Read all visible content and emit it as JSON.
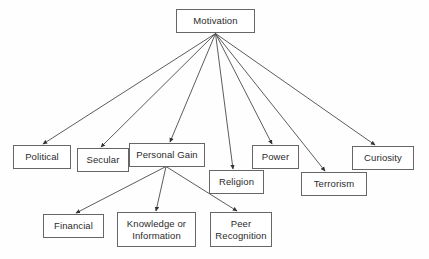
{
  "diagram": {
    "type": "tree-diagram",
    "colors": {
      "background": "#fefefe",
      "node_border": "#666666",
      "node_fill": "#ffffff",
      "text": "#2b2b2b",
      "edge": "#4a4a4a"
    },
    "nodes": [
      {
        "id": "motivation",
        "label": "Motivation",
        "x": 176,
        "y": 9,
        "w": 79,
        "h": 24,
        "level": 0
      },
      {
        "id": "political",
        "label": "Political",
        "x": 13,
        "y": 145,
        "w": 58,
        "h": 24,
        "level": 1
      },
      {
        "id": "secular",
        "label": "Secular",
        "x": 77,
        "y": 148,
        "w": 52,
        "h": 24,
        "level": 1
      },
      {
        "id": "personal-gain",
        "label": "Personal Gain",
        "x": 129,
        "y": 143,
        "w": 76,
        "h": 24,
        "level": 1
      },
      {
        "id": "religion",
        "label": "Religion",
        "x": 209,
        "y": 170,
        "w": 55,
        "h": 24,
        "level": 1
      },
      {
        "id": "power",
        "label": "Power",
        "x": 252,
        "y": 145,
        "w": 47,
        "h": 24,
        "level": 1
      },
      {
        "id": "terrorism",
        "label": "Terrorism",
        "x": 301,
        "y": 172,
        "w": 66,
        "h": 24,
        "level": 1
      },
      {
        "id": "curiosity",
        "label": "Curiosity",
        "x": 352,
        "y": 146,
        "w": 62,
        "h": 24,
        "level": 1
      },
      {
        "id": "financial",
        "label": "Financial",
        "x": 43,
        "y": 214,
        "w": 61,
        "h": 24,
        "level": 2
      },
      {
        "id": "knowledge-or-information",
        "label": "Knowledge or\nInformation",
        "x": 117,
        "y": 212,
        "w": 79,
        "h": 35,
        "level": 2
      },
      {
        "id": "peer-recognition",
        "label": "Peer\nRecognition",
        "x": 210,
        "y": 212,
        "w": 62,
        "h": 35,
        "level": 2
      }
    ],
    "edges": [
      {
        "from": "motivation",
        "to": "political",
        "x1": 215.5,
        "y1": 33.5,
        "x2": 43,
        "y2": 144
      },
      {
        "from": "motivation",
        "to": "secular",
        "x1": 215.5,
        "y1": 33.5,
        "x2": 101,
        "y2": 147
      },
      {
        "from": "motivation",
        "to": "personal-gain",
        "x1": 215.5,
        "y1": 33.5,
        "x2": 170,
        "y2": 142
      },
      {
        "from": "motivation",
        "to": "religion",
        "x1": 215.5,
        "y1": 33.5,
        "x2": 233,
        "y2": 169
      },
      {
        "from": "motivation",
        "to": "power",
        "x1": 215.5,
        "y1": 33.5,
        "x2": 272,
        "y2": 144
      },
      {
        "from": "motivation",
        "to": "terrorism",
        "x1": 215.5,
        "y1": 33.5,
        "x2": 325,
        "y2": 171
      },
      {
        "from": "motivation",
        "to": "curiosity",
        "x1": 215.5,
        "y1": 33.5,
        "x2": 375,
        "y2": 145
      },
      {
        "from": "personal-gain",
        "to": "financial",
        "x1": 166,
        "y1": 166.5,
        "x2": 76,
        "y2": 213
      },
      {
        "from": "personal-gain",
        "to": "knowledge-or-information",
        "x1": 166,
        "y1": 166.5,
        "x2": 156,
        "y2": 211
      },
      {
        "from": "personal-gain",
        "to": "peer-recognition",
        "x1": 166,
        "y1": 166.5,
        "x2": 237,
        "y2": 211
      }
    ]
  }
}
